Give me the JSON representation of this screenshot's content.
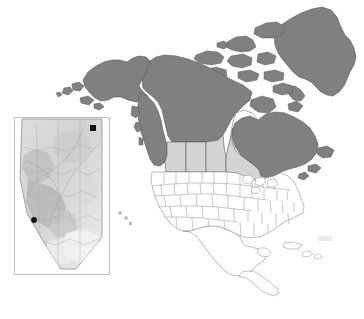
{
  "figure": {
    "kind": "choropleth-map",
    "title": "",
    "caption": "",
    "background_color": "#ffffff"
  },
  "colors": {
    "background": "#ffffff",
    "dark_fill": "#808080",
    "light_fill": "#d4d4d4",
    "white_fill": "#ffffff",
    "outline": "#595959",
    "thin_outline": "#9a9a9a",
    "marker": "#111111",
    "inset_border": "#b4b4b4",
    "inset_fill": "#d9d9d9",
    "inset_shade": "#bdbdbd",
    "inset_light": "#efefef"
  },
  "main_map": {
    "name": "north-america-map",
    "regions": [
      {
        "id": "greenland",
        "label": "Greenland",
        "shade": "dark"
      },
      {
        "id": "alaska",
        "label": "Alaska",
        "shade": "dark"
      },
      {
        "id": "yukon",
        "label": "Yukon",
        "shade": "dark"
      },
      {
        "id": "northwest-territories",
        "label": "Northwest Territories",
        "shade": "dark"
      },
      {
        "id": "nunavut",
        "label": "Nunavut",
        "shade": "dark"
      },
      {
        "id": "british-columbia",
        "label": "British Columbia",
        "shade": "dark"
      },
      {
        "id": "alberta",
        "label": "Alberta",
        "shade": "light"
      },
      {
        "id": "saskatchewan",
        "label": "Saskatchewan",
        "shade": "light"
      },
      {
        "id": "manitoba",
        "label": "Manitoba",
        "shade": "light"
      },
      {
        "id": "ontario",
        "label": "Ontario",
        "shade": "light"
      },
      {
        "id": "quebec",
        "label": "Quebec",
        "shade": "dark"
      },
      {
        "id": "atlantic-canada",
        "label": "Atlantic Canada",
        "shade": "dark"
      },
      {
        "id": "united-states",
        "label": "United States",
        "shade": "white"
      },
      {
        "id": "mexico",
        "label": "Mexico",
        "shade": "white"
      },
      {
        "id": "central-america",
        "label": "Central America",
        "shade": "white"
      },
      {
        "id": "caribbean-islands",
        "label": "Caribbean Islands",
        "shade": "white"
      }
    ]
  },
  "inset_map": {
    "name": "alberta-inset-map",
    "region_label": "Alberta",
    "markers": [
      {
        "id": "marker-northeast",
        "label": "",
        "x": 79,
        "y": 11
      },
      {
        "id": "marker-southwest",
        "label": "",
        "x": 20,
        "y": 103
      }
    ]
  },
  "annotations": {
    "faint_artifact": ""
  }
}
